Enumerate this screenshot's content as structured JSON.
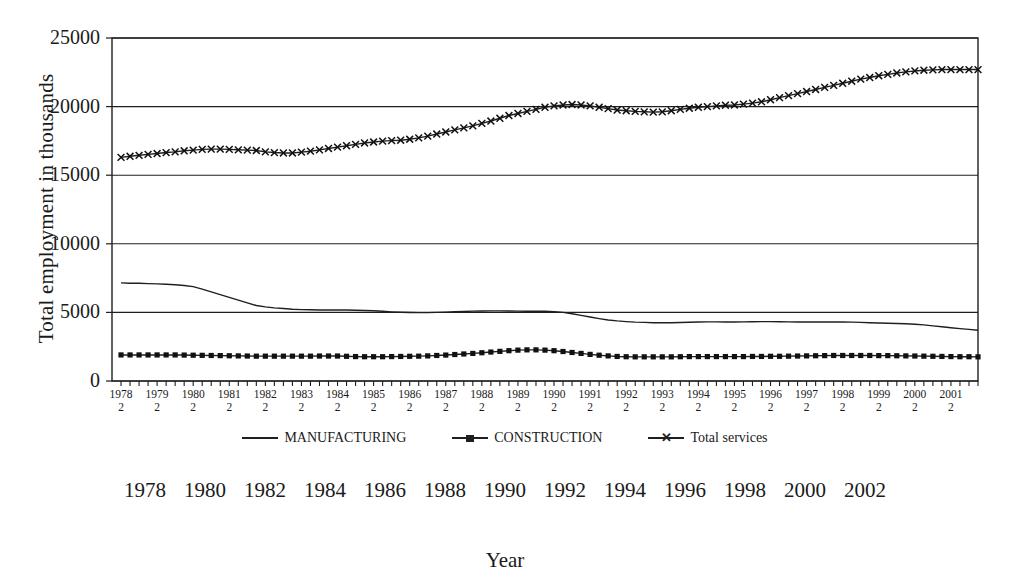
{
  "chart_data": {
    "type": "line",
    "title": "",
    "xlabel": "Year",
    "ylabel": "Total employment in thousands",
    "ylim": [
      0,
      25000
    ],
    "ytick_values": [
      0,
      5000,
      10000,
      15000,
      20000,
      25000
    ],
    "ytick_labels": [
      "0",
      "5000",
      "10000",
      "15000",
      "20000",
      "25000"
    ],
    "grid": "horizontal",
    "legend_position": "bottom",
    "x_axis_note": "quarterly observations; tick labels show year and quarter 2",
    "xtick_labels": [
      {
        "year": "1978",
        "quarter": "2"
      },
      {
        "year": "1979",
        "quarter": "2"
      },
      {
        "year": "1980",
        "quarter": "2"
      },
      {
        "year": "1981",
        "quarter": "2"
      },
      {
        "year": "1982",
        "quarter": "2"
      },
      {
        "year": "1983",
        "quarter": "2"
      },
      {
        "year": "1984",
        "quarter": "2"
      },
      {
        "year": "1985",
        "quarter": "2"
      },
      {
        "year": "1986",
        "quarter": "2"
      },
      {
        "year": "1987",
        "quarter": "2"
      },
      {
        "year": "1988",
        "quarter": "2"
      },
      {
        "year": "1989",
        "quarter": "2"
      },
      {
        "year": "1990",
        "quarter": "2"
      },
      {
        "year": "1991",
        "quarter": "2"
      },
      {
        "year": "1992",
        "quarter": "2"
      },
      {
        "year": "1993",
        "quarter": "2"
      },
      {
        "year": "1994",
        "quarter": "2"
      },
      {
        "year": "1995",
        "quarter": "2"
      },
      {
        "year": "1996",
        "quarter": "2"
      },
      {
        "year": "1997",
        "quarter": "2"
      },
      {
        "year": "1998",
        "quarter": "2"
      },
      {
        "year": "1999",
        "quarter": "2"
      },
      {
        "year": "2000",
        "quarter": "2"
      },
      {
        "year": "2001",
        "quarter": "2"
      }
    ],
    "secondary_year_labels": [
      "1978",
      "1980",
      "1982",
      "1984",
      "1986",
      "1988",
      "1990",
      "1992",
      "1994",
      "1996",
      "1998",
      "2000",
      "2002"
    ],
    "x": [
      1978.25,
      1978.5,
      1978.75,
      1979.0,
      1979.25,
      1979.5,
      1979.75,
      1980.0,
      1980.25,
      1980.5,
      1980.75,
      1981.0,
      1981.25,
      1981.5,
      1981.75,
      1982.0,
      1982.25,
      1982.5,
      1982.75,
      1983.0,
      1983.25,
      1983.5,
      1983.75,
      1984.0,
      1984.25,
      1984.5,
      1984.75,
      1985.0,
      1985.25,
      1985.5,
      1985.75,
      1986.0,
      1986.25,
      1986.5,
      1986.75,
      1987.0,
      1987.25,
      1987.5,
      1987.75,
      1988.0,
      1988.25,
      1988.5,
      1988.75,
      1989.0,
      1989.25,
      1989.5,
      1989.75,
      1990.0,
      1990.25,
      1990.5,
      1990.75,
      1991.0,
      1991.25,
      1991.5,
      1991.75,
      1992.0,
      1992.25,
      1992.5,
      1992.75,
      1993.0,
      1993.25,
      1993.5,
      1993.75,
      1994.0,
      1994.25,
      1994.5,
      1994.75,
      1995.0,
      1995.25,
      1995.5,
      1995.75,
      1996.0,
      1996.25,
      1996.5,
      1996.75,
      1997.0,
      1997.25,
      1997.5,
      1997.75,
      1998.0,
      1998.25,
      1998.5,
      1998.75,
      1999.0,
      1999.25,
      1999.5,
      1999.75,
      2000.0,
      2000.25,
      2000.5,
      2000.75,
      2001.0,
      2001.25,
      2001.5,
      2001.75,
      2002.0
    ],
    "series": [
      {
        "name": "MANUFACTURING",
        "marker": "none",
        "values": [
          7150,
          7130,
          7120,
          7100,
          7080,
          7050,
          7010,
          6960,
          6880,
          6700,
          6500,
          6300,
          6100,
          5900,
          5700,
          5500,
          5400,
          5330,
          5280,
          5230,
          5200,
          5190,
          5180,
          5180,
          5180,
          5170,
          5160,
          5140,
          5120,
          5080,
          5040,
          5010,
          4990,
          4980,
          4980,
          5000,
          5020,
          5050,
          5070,
          5090,
          5100,
          5110,
          5110,
          5100,
          5090,
          5080,
          5080,
          5080,
          5060,
          5000,
          4900,
          4780,
          4660,
          4550,
          4450,
          4380,
          4330,
          4290,
          4270,
          4250,
          4250,
          4250,
          4260,
          4280,
          4300,
          4310,
          4310,
          4300,
          4300,
          4310,
          4320,
          4330,
          4330,
          4320,
          4310,
          4300,
          4300,
          4300,
          4300,
          4300,
          4300,
          4290,
          4270,
          4250,
          4230,
          4210,
          4190,
          4170,
          4140,
          4090,
          4020,
          3950,
          3880,
          3820,
          3760,
          3700
        ]
      },
      {
        "name": "CONSTRUCTION",
        "marker": "square",
        "values": [
          1900,
          1900,
          1900,
          1900,
          1900,
          1900,
          1900,
          1890,
          1880,
          1870,
          1860,
          1850,
          1840,
          1830,
          1820,
          1810,
          1810,
          1810,
          1810,
          1810,
          1810,
          1810,
          1820,
          1820,
          1820,
          1800,
          1780,
          1770,
          1770,
          1770,
          1780,
          1790,
          1800,
          1810,
          1830,
          1860,
          1890,
          1930,
          1970,
          2010,
          2060,
          2110,
          2160,
          2210,
          2250,
          2270,
          2270,
          2250,
          2210,
          2150,
          2080,
          2010,
          1940,
          1880,
          1830,
          1790,
          1770,
          1760,
          1760,
          1760,
          1760,
          1760,
          1770,
          1780,
          1780,
          1780,
          1780,
          1780,
          1780,
          1780,
          1790,
          1790,
          1800,
          1800,
          1810,
          1820,
          1830,
          1840,
          1850,
          1860,
          1860,
          1860,
          1860,
          1860,
          1850,
          1850,
          1840,
          1830,
          1820,
          1810,
          1800,
          1790,
          1780,
          1770,
          1770,
          1760
        ]
      },
      {
        "name": "Total services",
        "marker": "x",
        "values": [
          16300,
          16380,
          16450,
          16520,
          16580,
          16650,
          16700,
          16780,
          16830,
          16880,
          16900,
          16900,
          16880,
          16850,
          16830,
          16800,
          16700,
          16650,
          16620,
          16620,
          16680,
          16750,
          16850,
          16950,
          17050,
          17150,
          17250,
          17350,
          17420,
          17480,
          17520,
          17550,
          17620,
          17720,
          17850,
          18000,
          18150,
          18300,
          18450,
          18600,
          18780,
          18950,
          19150,
          19350,
          19500,
          19650,
          19800,
          19950,
          20050,
          20120,
          20150,
          20120,
          20050,
          19950,
          19850,
          19750,
          19700,
          19650,
          19620,
          19600,
          19620,
          19700,
          19800,
          19880,
          19950,
          20000,
          20050,
          20100,
          20120,
          20180,
          20250,
          20350,
          20500,
          20650,
          20800,
          20950,
          21100,
          21250,
          21400,
          21550,
          21700,
          21850,
          22000,
          22120,
          22250,
          22350,
          22450,
          22530,
          22600,
          22650,
          22680,
          22700,
          22700,
          22700,
          22700,
          22700
        ]
      }
    ]
  }
}
